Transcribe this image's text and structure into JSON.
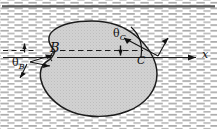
{
  "figure": {
    "type": "diagram",
    "description_labels": {
      "point_b": "B",
      "point_c": "C",
      "angle_b": "θ",
      "angle_b_sub": "B",
      "angle_c": "θ",
      "angle_c_sub": "C",
      "axis_x": "x"
    },
    "colors": {
      "blob_fill": "#c9c9c9",
      "blob_stroke": "#1a1a1a",
      "background_hatch": "#8a8a8a",
      "top_wall": "#555555",
      "line": "#111111",
      "page": "#ffffff"
    },
    "geometry": {
      "canvas": [
        217,
        129
      ],
      "top_wall_y": 6,
      "reference_line_y": 57,
      "dashed_line_y": 51,
      "axis_arrow_from_x": 128,
      "axis_arrow_to_x": 196,
      "point_b": [
        55,
        51
      ],
      "point_c": [
        141,
        57
      ]
    },
    "icon_names": {
      "arrow_right": "arrow-right-icon",
      "arrow_angle_b": "angle-arrow-b-icon",
      "arrow_angle_c": "angle-arrow-c-icon",
      "tick_b": "tick-mark-b-icon",
      "tick_c": "tick-mark-c-icon"
    }
  }
}
